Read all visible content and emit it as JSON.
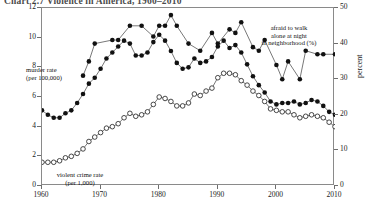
{
  "title": "Chart 2.7  Violence in America, 1960–2010",
  "annotations": {
    "afraid": "afraid to walk\nalone at night\nin neighborhood (%)",
    "murder": "murder rate\n(per 100,000)",
    "violent": "violent crime rate\n(per 1,000)"
  },
  "axes": {
    "right_title": "percent",
    "left_ticks": [
      "0",
      "2",
      "4",
      "6",
      "8",
      "10",
      "12"
    ],
    "right_ticks": [
      "0",
      "10",
      "20",
      "30",
      "40",
      "50"
    ],
    "x_ticks": [
      "1960",
      "1970",
      "1980",
      "1990",
      "2000",
      "2010"
    ]
  },
  "chart_data": {
    "type": "line",
    "title": "Chart 2.7  Violence in America, 1960–2010",
    "xlabel": "",
    "ylabel": "",
    "y2label": "percent",
    "xlim": [
      1960,
      2010
    ],
    "ylim": [
      0,
      12
    ],
    "y2lim": [
      0,
      50
    ],
    "grid": false,
    "legend": "annotations",
    "xticks": [
      1960,
      1970,
      1980,
      1990,
      2000,
      2010
    ],
    "yticks": [
      0,
      2,
      4,
      6,
      8,
      10,
      12
    ],
    "y2ticks": [
      0,
      10,
      20,
      30,
      40,
      50
    ],
    "series": [
      {
        "name": "afraid to walk alone at night in neighborhood (%)",
        "axis": "right",
        "marker": "filled-circle",
        "units": "percent",
        "x": [
          1967,
          1968,
          1969,
          1972,
          1973,
          1975,
          1977,
          1979,
          1980,
          1981,
          1982,
          1983,
          1985,
          1987,
          1989,
          1990,
          1992,
          1993,
          1994,
          1996,
          1997,
          1998,
          2000,
          2001,
          2002,
          2004,
          2005,
          2007,
          2008,
          2010
        ],
        "values": [
          31,
          35,
          40,
          41,
          41,
          45,
          45,
          42,
          45,
          45,
          48,
          45,
          40,
          38,
          43,
          40,
          44,
          43,
          46,
          39,
          38,
          41,
          34,
          30,
          35,
          30,
          38,
          37,
          37,
          37
        ]
      },
      {
        "name": "murder rate (per 100,000)",
        "axis": "left",
        "marker": "filled-circle",
        "units": "per 100,000",
        "x": [
          1960,
          1961,
          1962,
          1963,
          1964,
          1965,
          1966,
          1967,
          1968,
          1969,
          1970,
          1971,
          1972,
          1973,
          1974,
          1975,
          1976,
          1977,
          1978,
          1979,
          1980,
          1981,
          1982,
          1983,
          1984,
          1985,
          1986,
          1987,
          1988,
          1989,
          1990,
          1991,
          1992,
          1993,
          1994,
          1995,
          1996,
          1997,
          1998,
          1999,
          2000,
          2001,
          2002,
          2003,
          2004,
          2005,
          2006,
          2007,
          2008,
          2009,
          2010
        ],
        "values": [
          5.1,
          4.8,
          4.6,
          4.6,
          4.9,
          5.1,
          5.6,
          6.2,
          6.9,
          7.3,
          7.9,
          8.6,
          9.0,
          9.4,
          9.8,
          9.6,
          8.8,
          8.8,
          9.0,
          9.7,
          10.2,
          9.8,
          9.1,
          8.3,
          7.9,
          8.0,
          8.6,
          8.3,
          8.4,
          8.7,
          9.4,
          9.8,
          9.3,
          9.5,
          9.0,
          8.2,
          7.4,
          6.8,
          6.3,
          5.7,
          5.5,
          5.6,
          5.6,
          5.7,
          5.5,
          5.6,
          5.8,
          5.7,
          5.4,
          5.0,
          4.8
        ]
      },
      {
        "name": "violent crime rate (per 1,000)",
        "axis": "left",
        "marker": "open-circle",
        "units": "per 1,000",
        "x": [
          1960,
          1961,
          1962,
          1963,
          1964,
          1965,
          1966,
          1967,
          1968,
          1969,
          1970,
          1971,
          1972,
          1973,
          1974,
          1975,
          1976,
          1977,
          1978,
          1979,
          1980,
          1981,
          1982,
          1983,
          1984,
          1985,
          1986,
          1987,
          1988,
          1989,
          1990,
          1991,
          1992,
          1993,
          1994,
          1995,
          1996,
          1997,
          1998,
          1999,
          2000,
          2001,
          2002,
          2003,
          2004,
          2005,
          2006,
          2007,
          2008,
          2009,
          2010
        ],
        "values": [
          1.6,
          1.6,
          1.6,
          1.7,
          1.9,
          2.0,
          2.2,
          2.5,
          3.0,
          3.3,
          3.6,
          3.9,
          4.0,
          4.2,
          4.6,
          4.9,
          4.7,
          4.8,
          5.0,
          5.5,
          6.0,
          5.9,
          5.7,
          5.4,
          5.4,
          5.6,
          6.2,
          6.1,
          6.4,
          6.6,
          7.3,
          7.6,
          7.6,
          7.5,
          7.1,
          6.8,
          6.4,
          6.1,
          5.7,
          5.2,
          5.1,
          5.0,
          5.0,
          4.8,
          4.6,
          4.7,
          4.8,
          4.7,
          4.6,
          4.3,
          4.0
        ]
      }
    ]
  }
}
